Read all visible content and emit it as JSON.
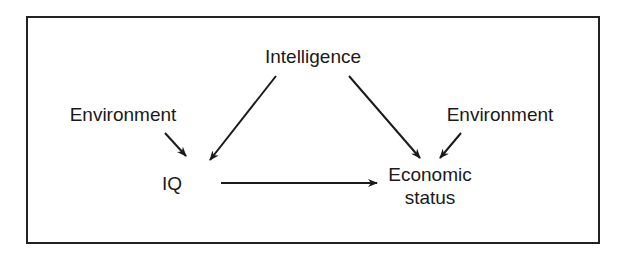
{
  "diagram": {
    "nodes": {
      "intelligence": "Intelligence",
      "environment_left": "Environment",
      "environment_right": "Environment",
      "iq": "IQ",
      "economic_status_line1": "Economic",
      "economic_status_line2": "status"
    },
    "edges": [
      {
        "from": "Intelligence",
        "to": "IQ"
      },
      {
        "from": "Intelligence",
        "to": "Economic status"
      },
      {
        "from": "Environment (left)",
        "to": "IQ"
      },
      {
        "from": "Environment (right)",
        "to": "Economic status"
      },
      {
        "from": "IQ",
        "to": "Economic status"
      }
    ],
    "colors": {
      "line": "#1a1a1a",
      "background": "#ffffff"
    }
  }
}
